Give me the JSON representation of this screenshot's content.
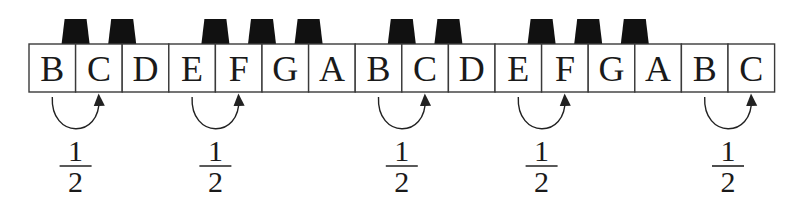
{
  "diagram": {
    "type": "piano-keyboard-half-steps",
    "white_keys": [
      "B",
      "C",
      "D",
      "E",
      "F",
      "G",
      "A",
      "B",
      "C",
      "D",
      "E",
      "F",
      "G",
      "A",
      "B",
      "C"
    ],
    "black_key_after_indices": [
      1,
      2,
      4,
      5,
      6,
      8,
      9,
      11,
      12,
      13
    ],
    "half_steps": [
      {
        "from": "B",
        "to": "C",
        "from_index": 0,
        "to_index": 1,
        "label_num": "1",
        "label_den": "2"
      },
      {
        "from": "E",
        "to": "F",
        "from_index": 3,
        "to_index": 4,
        "label_num": "1",
        "label_den": "2"
      },
      {
        "from": "B",
        "to": "C",
        "from_index": 7,
        "to_index": 8,
        "label_num": "1",
        "label_den": "2"
      },
      {
        "from": "E",
        "to": "F",
        "from_index": 10,
        "to_index": 11,
        "label_num": "1",
        "label_den": "2"
      },
      {
        "from": "B",
        "to": "C",
        "from_index": 14,
        "to_index": 15,
        "label_num": "1",
        "label_den": "2"
      }
    ],
    "colors": {
      "line": "#3a3a3a",
      "black_key": "#111111",
      "text": "#1a1a1a"
    }
  }
}
